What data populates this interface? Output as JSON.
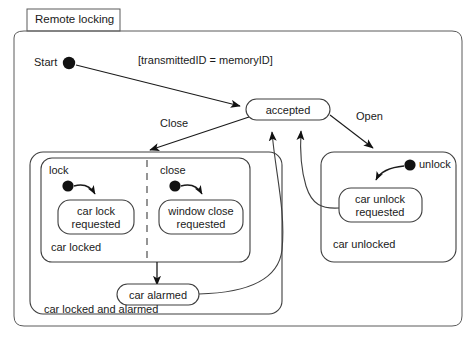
{
  "diagram": {
    "title": "Remote locking",
    "type": "uml-state-machine",
    "colors": {
      "stroke": "#3f3f3f",
      "stroke_dark": "#1a1a1a",
      "fill": "#ffffff",
      "text": "#1a1a1a",
      "node_fill": "#000000"
    }
  },
  "nodes": {
    "start_label": "Start",
    "accepted": "accepted",
    "car_lock_requested": "car lock\nrequested",
    "car_lock_requested_line1": "car lock",
    "car_lock_requested_line2": "requested",
    "window_close_requested_line1": "window close",
    "window_close_requested_line2": "requested",
    "car_unlock_requested_line1": "car unlock",
    "car_unlock_requested_line2": "requested",
    "car_alarmed": "car alarmed"
  },
  "regions": {
    "car_locked": "car locked",
    "car_locked_and_alarmed": "car locked and alarmed",
    "car_unlocked": "car unlocked"
  },
  "triggers": {
    "lock": "lock",
    "close": "close",
    "unlock": "unlock"
  },
  "transitions": {
    "guard": "[transmittedID =   memoryID]",
    "close_event": "Close",
    "open_event": "Open"
  }
}
